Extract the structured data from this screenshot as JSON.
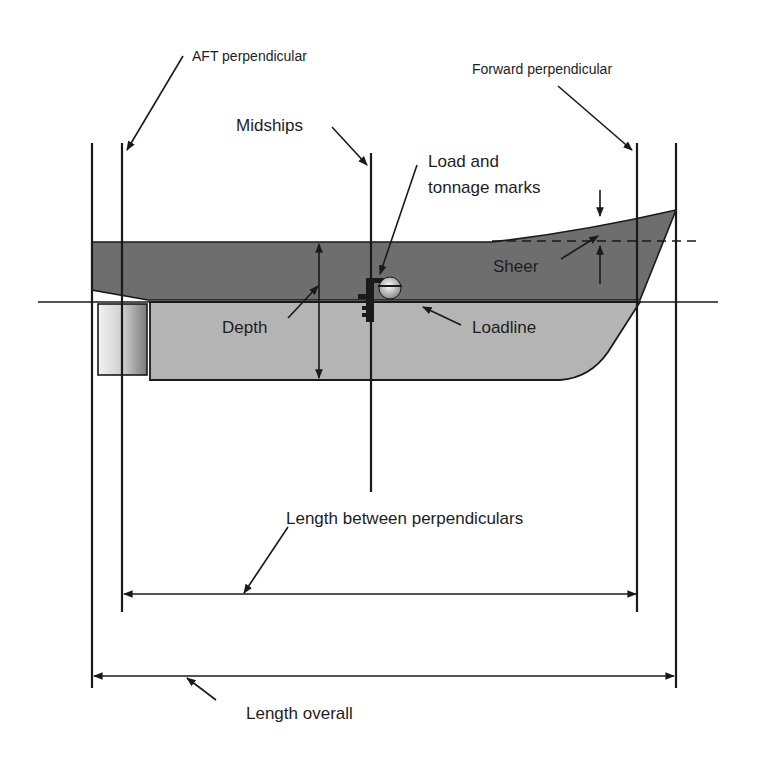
{
  "diagram": {
    "labels": {
      "aft_perpendicular": "AFT perpendicular",
      "forward_perpendicular": "Forward perpendicular",
      "midships": "Midships",
      "load_marks_line1": "Load and",
      "load_marks_line2": "tonnage marks",
      "sheer": "Sheer",
      "depth": "Depth",
      "loadline": "Loadline",
      "lbp": "Length between perpendiculars",
      "loa": "Length overall"
    },
    "colors": {
      "above_water_hull": "#6e6e6e",
      "below_water_hull": "#b4b4b4",
      "outline": "#1a1a1a",
      "rudder_light": "#f0f0f0",
      "rudder_dark": "#7a7a7a"
    }
  }
}
